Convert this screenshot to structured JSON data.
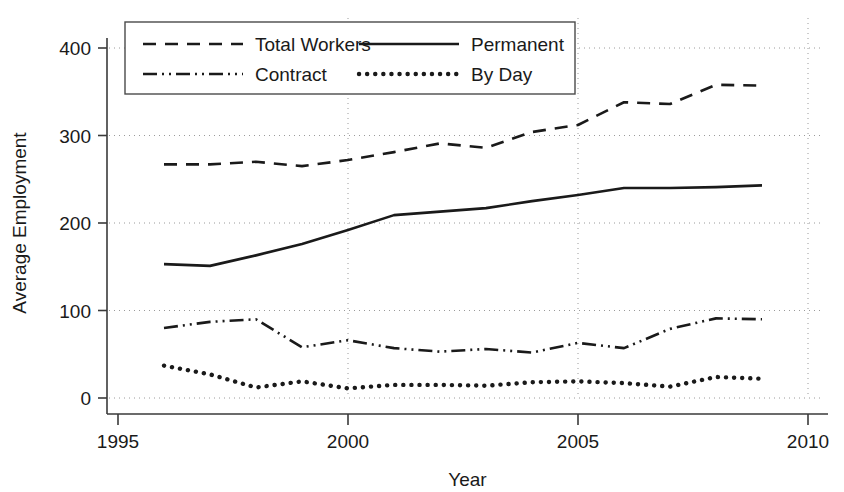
{
  "chart_data": {
    "type": "line",
    "title": "",
    "xlabel": "Year",
    "ylabel": "Average Employment",
    "xlim": [
      1995,
      2010
    ],
    "ylim": [
      0,
      420
    ],
    "xticks": [
      "1995",
      "2000",
      "2005",
      "2010"
    ],
    "xtick_values": [
      1995,
      2000,
      2005,
      2010
    ],
    "yticks": [
      "0",
      "100",
      "200",
      "300",
      "400"
    ],
    "ytick_values": [
      0,
      100,
      200,
      300,
      400
    ],
    "grid": "dotted horizontal and vertical gridlines at ticks",
    "legend_position": "top-left inside plot, boxed, 2 columns",
    "x": [
      1996,
      1997,
      1998,
      1999,
      2000,
      2001,
      2002,
      2003,
      2004,
      2005,
      2006,
      2007,
      2008,
      2009
    ],
    "series": [
      {
        "name": "Total Workers",
        "style": "dashed",
        "color": "#1a1a1a",
        "values": [
          267,
          267,
          270,
          265,
          272,
          281,
          291,
          286,
          304,
          312,
          338,
          336,
          358,
          357
        ]
      },
      {
        "name": "Permanent",
        "style": "solid",
        "color": "#1a1a1a",
        "values": [
          153,
          151,
          163,
          176,
          192,
          209,
          213,
          217,
          225,
          232,
          240,
          240,
          241,
          243
        ]
      },
      {
        "name": "Contract",
        "style": "dash-dot-dot",
        "color": "#1a1a1a",
        "values": [
          80,
          87,
          90,
          58,
          66,
          57,
          53,
          56,
          52,
          63,
          57,
          79,
          91,
          90
        ]
      },
      {
        "name": "By Day",
        "style": "dotted",
        "color": "#1a1a1a",
        "values": [
          37,
          27,
          12,
          19,
          11,
          15,
          15,
          14,
          18,
          19,
          17,
          13,
          24,
          22
        ]
      }
    ]
  },
  "legend": {
    "entries": [
      {
        "label": "Total Workers",
        "style": "dashed"
      },
      {
        "label": "Permanent",
        "style": "solid"
      },
      {
        "label": "Contract",
        "style": "dash-dot-dot"
      },
      {
        "label": "By Day",
        "style": "dotted"
      }
    ]
  }
}
